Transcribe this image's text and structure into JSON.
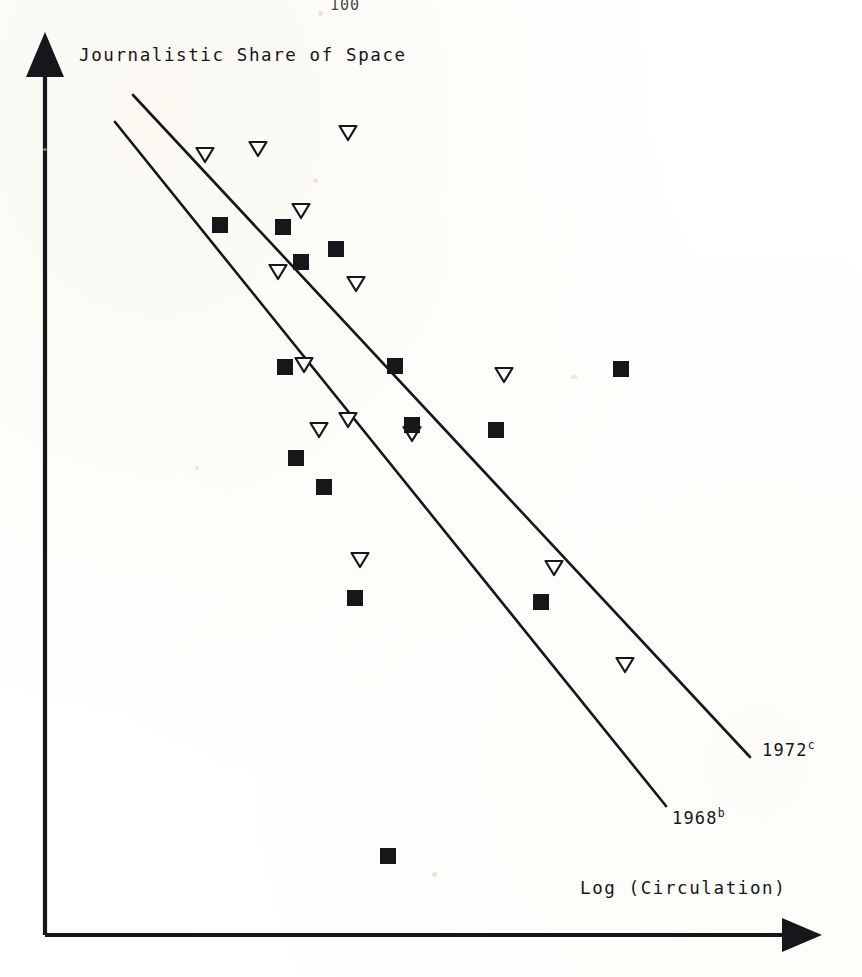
{
  "page": {
    "page_number": "100",
    "background_color": "#ffffff",
    "ink_color": "#17161a"
  },
  "axes": {
    "y_axis_label": "Journalistic Share of Space",
    "x_axis_label": "Log (Circulation)",
    "y_arrow_icon": "up-arrow-icon",
    "x_arrow_icon": "right-arrow-icon",
    "origin_px": [
      45,
      935
    ],
    "y_top_px": [
      45,
      32
    ],
    "x_right_px": [
      822,
      935
    ]
  },
  "fit_lines": [
    {
      "name": "1972",
      "label_text": "1972",
      "label_superscript": "c",
      "x1": 133,
      "y1": 95,
      "x2": 750,
      "y2": 757
    },
    {
      "name": "1968",
      "label_text": "1968",
      "label_superscript": "b",
      "x1": 115,
      "y1": 122,
      "x2": 666,
      "y2": 806
    }
  ],
  "chart_data": {
    "type": "scatter",
    "title": "",
    "xlabel": "Log (Circulation)",
    "ylabel": "Journalistic Share of Space",
    "grid": false,
    "legend_position": "none",
    "axis_ticks": false,
    "axis_tick_labels": false,
    "note": "Axes are unlabeled arrows with no numeric ticks; point positions are recorded in pixel coordinates of the plotting area. Higher y on screen means a LOWER pixel value.",
    "series": [
      {
        "name": "1972",
        "marker": "open-down-triangle",
        "marker_fill": "#ffffff",
        "marker_stroke": "#17161a",
        "count": 14,
        "points_px": [
          [
            205,
            155
          ],
          [
            258,
            149
          ],
          [
            348,
            133
          ],
          [
            301,
            211
          ],
          [
            278,
            272
          ],
          [
            356,
            284
          ],
          [
            304,
            365
          ],
          [
            504,
            375
          ],
          [
            348,
            420
          ],
          [
            319,
            430
          ],
          [
            412,
            434
          ],
          [
            554,
            568
          ],
          [
            360,
            560
          ],
          [
            625,
            665
          ]
        ]
      },
      {
        "name": "1968",
        "marker": "filled-square",
        "marker_fill": "#17161a",
        "marker_stroke": "#17161a",
        "count": 13,
        "points_px": [
          [
            220,
            225
          ],
          [
            283,
            227
          ],
          [
            336,
            249
          ],
          [
            301,
            262
          ],
          [
            285,
            367
          ],
          [
            395,
            366
          ],
          [
            621,
            369
          ],
          [
            412,
            425
          ],
          [
            496,
            430
          ],
          [
            296,
            458
          ],
          [
            324,
            487
          ],
          [
            355,
            598
          ],
          [
            541,
            602
          ],
          [
            388,
            856
          ]
        ]
      }
    ]
  }
}
